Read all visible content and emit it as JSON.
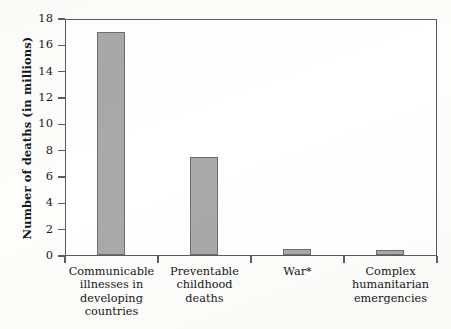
{
  "chart_data": {
    "type": "bar",
    "title": "",
    "xlabel": "",
    "ylabel": "Number of deaths (in millions)",
    "ylim": [
      0,
      18
    ],
    "ytick_step": 2,
    "grid": false,
    "legend": "none",
    "bar_color": "#a9a9a9",
    "bar_border_color": "#6e6e71",
    "axis_color": "#5c5c60",
    "categories": [
      "Communicable illnesses in developing countries",
      "Preventable childhood deaths",
      "War*",
      "Complex humanitarian emergencies"
    ],
    "category_lines": [
      [
        "Communicable",
        "illnesses in",
        "developing",
        "countries"
      ],
      [
        "Preventable",
        "childhood",
        "deaths"
      ],
      [
        "War*"
      ],
      [
        "Complex",
        "humanitarian",
        "emergencies"
      ]
    ],
    "values": [
      17.0,
      7.5,
      0.45,
      0.4
    ],
    "ytick_labels": [
      "18",
      "16",
      "14",
      "12",
      "10",
      "8",
      "6",
      "4",
      "2",
      "0"
    ],
    "ytick_values": [
      18,
      16,
      14,
      12,
      10,
      8,
      6,
      4,
      2,
      0
    ]
  }
}
